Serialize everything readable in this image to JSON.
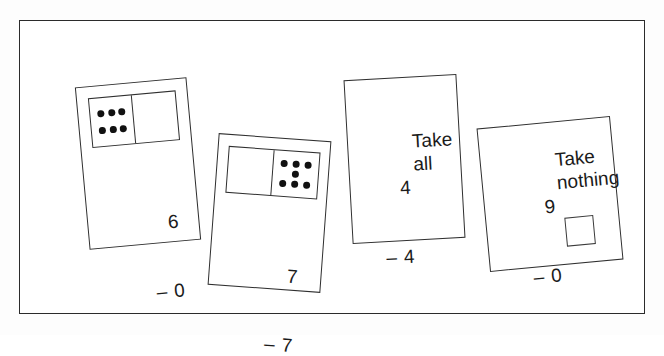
{
  "page": {
    "background_color": "#fdfdfd",
    "frame_color": "#2b2b2b",
    "card_background": "#ffffff",
    "ink_color": "#1b1b1b",
    "pip_color": "#111111"
  },
  "cards": [
    {
      "id": "card-1",
      "minuend": "6",
      "minus_sign": "–",
      "subtrahend": "0",
      "words_line1": "",
      "words_line2": "",
      "has_domino": true,
      "domino_left_pips": 6,
      "domino_right_pips": 0,
      "has_answer_box": false
    },
    {
      "id": "card-2",
      "minuend": "7",
      "minus_sign": "–",
      "subtrahend": "7",
      "words_line1": "",
      "words_line2": "",
      "has_domino": true,
      "domino_left_pips": 0,
      "domino_right_pips": 7,
      "has_answer_box": false
    },
    {
      "id": "card-3",
      "minuend": "4",
      "minus_sign": "–",
      "subtrahend": "4",
      "words_line1": "Take",
      "words_line2": "all",
      "has_domino": false,
      "domino_left_pips": 0,
      "domino_right_pips": 0,
      "has_answer_box": false
    },
    {
      "id": "card-4",
      "minuend": "9",
      "minus_sign": "–",
      "subtrahend": "0",
      "words_line1": "Take",
      "words_line2": "nothing",
      "has_domino": false,
      "domino_left_pips": 0,
      "domino_right_pips": 0,
      "has_answer_box": true
    }
  ]
}
